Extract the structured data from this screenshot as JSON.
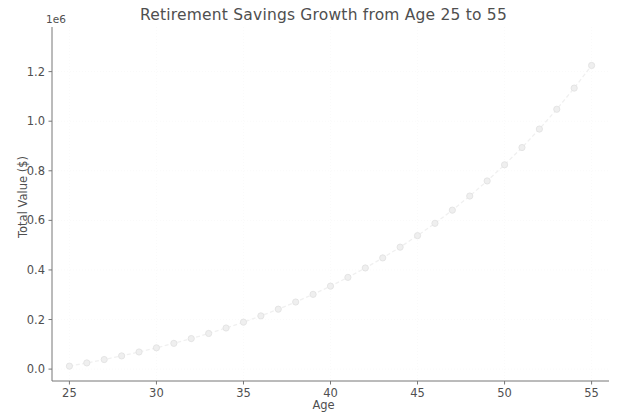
{
  "figure": {
    "width": 621,
    "height": 419,
    "background": "#ffffff"
  },
  "chart_data": {
    "type": "line",
    "title": "Retirement Savings Growth from Age 25 to 55",
    "xlabel": "Age",
    "ylabel": "Total Value ($)",
    "y_offset_label": "1e6",
    "y_offset_factor": 1000000,
    "xlim": [
      24.0,
      56.0
    ],
    "ylim": [
      -48000,
      1380000
    ],
    "xticks": [
      25,
      30,
      35,
      40,
      45,
      50,
      55
    ],
    "xticklabels": [
      "25",
      "30",
      "35",
      "40",
      "45",
      "50",
      "55"
    ],
    "yticks": [
      0,
      200000,
      400000,
      600000,
      800000,
      1000000,
      1200000
    ],
    "yticklabels": [
      "0.0",
      "0.2",
      "0.4",
      "0.6",
      "0.8",
      "1.0",
      "1.2"
    ],
    "grid": true,
    "grid_style": "dotted",
    "grid_color": "#fafafa",
    "legend": null,
    "line_color": "#f0f0f0",
    "line_style": "dashed",
    "marker": "circle",
    "marker_color": "#efefef",
    "marker_edge_color": "#e2e2e2",
    "x": [
      25,
      26,
      27,
      28,
      29,
      30,
      31,
      32,
      33,
      34,
      35,
      36,
      37,
      38,
      39,
      40,
      41,
      42,
      43,
      44,
      45,
      46,
      47,
      48,
      49,
      50,
      51,
      52,
      53,
      54,
      55
    ],
    "values": [
      12000,
      24840,
      38579,
      53279,
      69008,
      85838,
      103847,
      123117,
      143735,
      165797,
      189402,
      214661,
      241687,
      270605,
      301547,
      334655,
      370081,
      407987,
      448546,
      491944,
      538380,
      588067,
      641231,
      698117,
      758985,
      824114,
      893802,
      968368,
      1048154,
      1133525,
      1224872
    ],
    "series": [
      {
        "name": "Total Value",
        "values": [
          12000,
          24840,
          38579,
          53279,
          69008,
          85838,
          103847,
          123117,
          143735,
          165797,
          189402,
          214661,
          241687,
          270605,
          301547,
          334655,
          370081,
          407987,
          448546,
          491944,
          538380,
          588067,
          641231,
          698117,
          758985,
          824114,
          893802,
          968368,
          1048154,
          1133525,
          1224872
        ]
      }
    ]
  },
  "colors": {
    "text": "#4f4f4f",
    "spine": "#777777",
    "tick": "#777777",
    "grid": "#fafafa",
    "line": "#f0f0f0",
    "marker": "#efefef"
  }
}
